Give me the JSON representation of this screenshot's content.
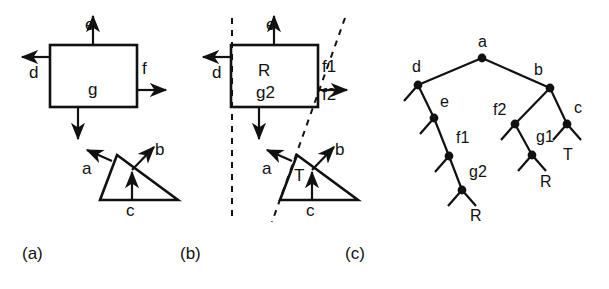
{
  "figure": {
    "background_color": "#ffffff",
    "ink_color": "#111111",
    "panels": [
      {
        "id": "a",
        "caption": "(a)",
        "caption_x": 22,
        "caption_y": 248
      },
      {
        "id": "b",
        "caption": "(b)",
        "caption_x": 180,
        "caption_y": 248
      },
      {
        "id": "c",
        "caption": "(c)",
        "caption_x": 345,
        "caption_y": 248
      }
    ]
  },
  "panel_a": {
    "square": {
      "x": 50,
      "y": 45,
      "w": 87,
      "h": 62
    },
    "triangle": {
      "apex_x": 117,
      "apex_y": 155,
      "base_left_x": 100,
      "base_left_y": 200,
      "base_right_x": 178,
      "base_right_y": 200
    },
    "labels": [
      {
        "name": "e",
        "text": "e",
        "x": 85,
        "y": 24
      },
      {
        "name": "d",
        "text": "d",
        "x": 29,
        "y": 72
      },
      {
        "name": "f",
        "text": "f",
        "x": 142,
        "y": 68
      },
      {
        "name": "g",
        "text": "g",
        "x": 88,
        "y": 89
      },
      {
        "name": "a",
        "text": "a",
        "x": 82,
        "y": 168
      },
      {
        "name": "b",
        "text": "b",
        "x": 155,
        "y": 149
      },
      {
        "name": "c",
        "text": "c",
        "x": 126,
        "y": 210
      }
    ]
  },
  "panel_b": {
    "square": {
      "x": 231,
      "y": 45,
      "w": 87,
      "h": 62
    },
    "triangle": {
      "apex_x": 297,
      "apex_y": 155,
      "base_left_x": 280,
      "base_left_y": 200,
      "base_right_x": 358,
      "base_right_y": 200
    },
    "cut_line_vertical": {
      "x": 232,
      "y1": 18,
      "y2": 222
    },
    "cut_line_slanted": {
      "x1": 345,
      "y1": 18,
      "x2": 272,
      "y2": 222
    },
    "labels": [
      {
        "name": "e",
        "text": "e",
        "x": 266,
        "y": 24
      },
      {
        "name": "d",
        "text": "d",
        "x": 212,
        "y": 72
      },
      {
        "name": "f1",
        "text": "f1",
        "x": 322,
        "y": 66
      },
      {
        "name": "f2",
        "text": "f2",
        "x": 322,
        "y": 94
      },
      {
        "name": "R",
        "text": "R",
        "x": 258,
        "y": 70
      },
      {
        "name": "g2",
        "text": "g2",
        "x": 258,
        "y": 92
      },
      {
        "name": "a",
        "text": "a",
        "x": 262,
        "y": 168
      },
      {
        "name": "b",
        "text": "b",
        "x": 335,
        "y": 149
      },
      {
        "name": "T",
        "text": "T",
        "x": 296,
        "y": 175
      },
      {
        "name": "c",
        "text": "c",
        "x": 306,
        "y": 210
      }
    ]
  },
  "panel_c": {
    "tree_type": "bsp-binary-tree",
    "nodes": [
      {
        "id": "a",
        "label": "a",
        "x": 482,
        "y": 58,
        "label_dx": -4,
        "label_dy": -12
      },
      {
        "id": "d",
        "label": "d",
        "x": 418,
        "y": 85,
        "label_dx": -6,
        "label_dy": -14
      },
      {
        "id": "b",
        "label": "b",
        "x": 550,
        "y": 88,
        "label_dx": -16,
        "label_dy": -14
      },
      {
        "id": "e",
        "label": "e",
        "x": 434,
        "y": 118,
        "label_dx": 6,
        "label_dy": -12
      },
      {
        "id": "f2",
        "label": "f2",
        "x": 515,
        "y": 124,
        "label_dx": -22,
        "label_dy": -10
      },
      {
        "id": "c",
        "label": "c",
        "x": 567,
        "y": 124,
        "label_dx": 7,
        "label_dy": -12
      },
      {
        "id": "f1",
        "label": "f1",
        "x": 449,
        "y": 156,
        "label_dx": 7,
        "label_dy": -14
      },
      {
        "id": "g1",
        "label": "g1",
        "x": 532,
        "y": 155,
        "label_dx": 4,
        "label_dy": -14
      },
      {
        "id": "g2",
        "label": "g2",
        "x": 462,
        "y": 190,
        "label_dx": 7,
        "label_dy": -14
      }
    ],
    "edges": [
      {
        "from": "a",
        "to": "d"
      },
      {
        "from": "a",
        "to": "b"
      },
      {
        "from": "d",
        "to": "e"
      },
      {
        "from": "b",
        "to": "f2"
      },
      {
        "from": "b",
        "to": "c"
      },
      {
        "from": "e",
        "to": "f1"
      },
      {
        "from": "f2",
        "to": "g1"
      },
      {
        "from": "f1",
        "to": "g2"
      }
    ],
    "leaf_stubs": [
      {
        "node": "d",
        "dx": -14,
        "dy": 16
      },
      {
        "node": "e",
        "dx": -14,
        "dy": 16
      },
      {
        "node": "f1",
        "dx": -14,
        "dy": 16
      },
      {
        "node": "g2",
        "dx": -14,
        "dy": 16
      },
      {
        "node": "g2",
        "dx": 14,
        "dy": 16
      },
      {
        "node": "f2",
        "dx": -14,
        "dy": 16
      },
      {
        "node": "g1",
        "dx": -14,
        "dy": 16
      },
      {
        "node": "g1",
        "dx": 14,
        "dy": 16
      },
      {
        "node": "c",
        "dx": -14,
        "dy": 16
      },
      {
        "node": "c",
        "dx": 14,
        "dy": 16
      }
    ],
    "leaf_labels": [
      {
        "name": "leaf-R-left",
        "text": "R",
        "x": 470,
        "y": 216
      },
      {
        "name": "leaf-R-right",
        "text": "R",
        "x": 540,
        "y": 182
      },
      {
        "name": "leaf-T",
        "text": "T",
        "x": 563,
        "y": 155
      }
    ]
  }
}
